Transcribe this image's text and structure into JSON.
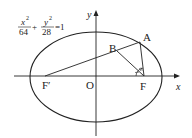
{
  "equation": {
    "term1_num": "x",
    "term1_den": "64",
    "plus": "+",
    "term2_num": "y",
    "term2_den": "28",
    "equals": "=1",
    "exponent": "2"
  },
  "axes": {
    "x_label": "x",
    "y_label": "y",
    "origin_label": "O"
  },
  "points": {
    "A": "A",
    "B": "B",
    "F": "F",
    "F_prime": "F′"
  },
  "colors": {
    "stroke": "#222222",
    "background": "#ffffff"
  }
}
